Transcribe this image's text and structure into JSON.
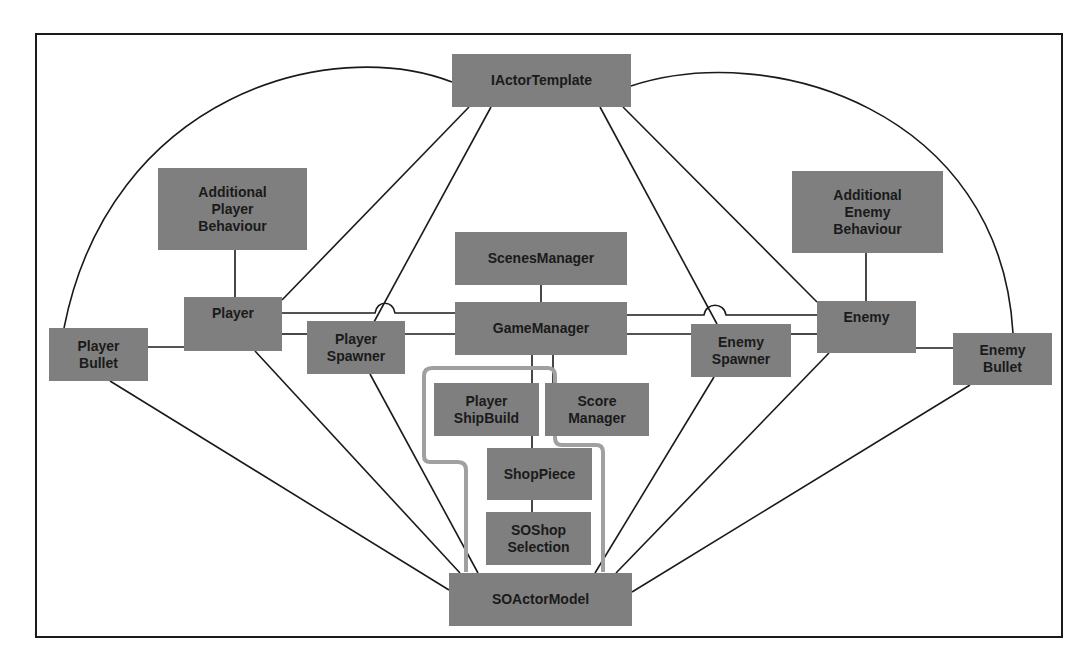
{
  "diagram": {
    "title": "",
    "colors": {
      "node_fill": "#7f7f7f",
      "line": "#1a1a1a",
      "highlight": "#9a9a9a",
      "border": "#1a1a1a"
    },
    "nodes": {
      "iactor_template": {
        "lines": [
          "IActorTemplate"
        ]
      },
      "additional_player_behaviour": {
        "lines": [
          "Additional",
          "Player",
          "Behaviour"
        ]
      },
      "additional_enemy_behaviour": {
        "lines": [
          "Additional",
          "Enemy",
          "Behaviour"
        ]
      },
      "scenes_manager": {
        "lines": [
          "ScenesManager"
        ]
      },
      "game_manager": {
        "lines": [
          "GameManager"
        ]
      },
      "player": {
        "lines": [
          "Player"
        ]
      },
      "player_spawner": {
        "lines": [
          "Player",
          "Spawner"
        ]
      },
      "player_bullet": {
        "lines": [
          "Player",
          "Bullet"
        ]
      },
      "enemy": {
        "lines": [
          "Enemy"
        ]
      },
      "enemy_spawner": {
        "lines": [
          "Enemy",
          "Spawner"
        ]
      },
      "enemy_bullet": {
        "lines": [
          "Enemy",
          "Bullet"
        ]
      },
      "player_shipbuild": {
        "lines": [
          "Player",
          "ShipBuild"
        ]
      },
      "score_manager": {
        "lines": [
          "Score",
          "Manager"
        ]
      },
      "shop_piece": {
        "lines": [
          "ShopPiece"
        ]
      },
      "soshop_selection": {
        "lines": [
          "SOShop",
          "Selection"
        ]
      },
      "soactor_model": {
        "lines": [
          "SOActorModel"
        ]
      }
    },
    "edges": [
      [
        "iactor_template",
        "player"
      ],
      [
        "iactor_template",
        "player_spawner"
      ],
      [
        "iactor_template",
        "enemy_spawner"
      ],
      [
        "iactor_template",
        "enemy"
      ],
      [
        "iactor_template",
        "player_bullet"
      ],
      [
        "iactor_template",
        "enemy_bullet"
      ],
      [
        "additional_player_behaviour",
        "player"
      ],
      [
        "additional_enemy_behaviour",
        "enemy"
      ],
      [
        "scenes_manager",
        "game_manager"
      ],
      [
        "player",
        "game_manager"
      ],
      [
        "player",
        "player_spawner"
      ],
      [
        "player_spawner",
        "game_manager"
      ],
      [
        "enemy",
        "game_manager"
      ],
      [
        "enemy_spawner",
        "enemy"
      ],
      [
        "game_manager",
        "enemy_spawner"
      ],
      [
        "player",
        "player_bullet"
      ],
      [
        "enemy",
        "enemy_bullet"
      ],
      [
        "game_manager",
        "player_shipbuild"
      ],
      [
        "game_manager",
        "score_manager"
      ],
      [
        "player_shipbuild",
        "shop_piece"
      ],
      [
        "shop_piece",
        "soshop_selection"
      ],
      [
        "player_bullet",
        "soactor_model"
      ],
      [
        "player",
        "soactor_model"
      ],
      [
        "player_spawner",
        "soactor_model"
      ],
      [
        "enemy_bullet",
        "soactor_model"
      ],
      [
        "enemy",
        "soactor_model"
      ],
      [
        "enemy_spawner",
        "soactor_model"
      ]
    ]
  }
}
